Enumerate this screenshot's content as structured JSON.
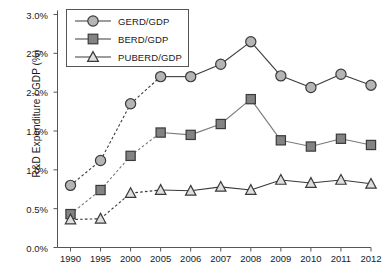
{
  "chart_data": {
    "type": "line",
    "title": "",
    "xlabel": "",
    "ylabel": "R&D Expenditure / GDP (%)",
    "categories": [
      "1990",
      "1995",
      "2000",
      "2005",
      "2006",
      "2007",
      "2008",
      "2009",
      "2010",
      "2011",
      "2012"
    ],
    "ylim": [
      0.0,
      3.0
    ],
    "ytick_labels": [
      "0.0%",
      "0.5%",
      "1.0%",
      "1.5%",
      "2.0%",
      "2.5%",
      "3.0%"
    ],
    "ytick_values": [
      0.0,
      0.5,
      1.0,
      1.5,
      2.0,
      2.5,
      3.0
    ],
    "grid": false,
    "legend_position": "top-left-inside",
    "series": [
      {
        "name": "GERD/GDP",
        "marker": "circle",
        "marker_fill": "#b5b5b5",
        "marker_stroke": "#3a3a3a",
        "line_color": "#3a3a3a",
        "values": [
          0.8,
          1.12,
          1.85,
          2.2,
          2.2,
          2.36,
          2.65,
          2.21,
          2.06,
          2.23,
          2.09
        ]
      },
      {
        "name": "BERD/GDP",
        "marker": "square",
        "marker_fill": "#838383",
        "marker_stroke": "#3a3a3a",
        "line_color": "#7a7a7a",
        "values": [
          0.43,
          0.74,
          1.18,
          1.48,
          1.45,
          1.59,
          1.91,
          1.38,
          1.3,
          1.4,
          1.32
        ]
      },
      {
        "name": "PUBERD/GDP",
        "marker": "triangle",
        "marker_fill": "#dedede",
        "marker_stroke": "#3a3a3a",
        "line_color": "#3a3a3a",
        "values": [
          0.36,
          0.37,
          0.7,
          0.74,
          0.73,
          0.78,
          0.74,
          0.87,
          0.83,
          0.87,
          0.82
        ]
      }
    ],
    "dashed_segment_categories": [
      "1990",
      "1995",
      "2000",
      "2005"
    ],
    "axis_color": "#555555"
  },
  "legend": {
    "items": [
      {
        "label": "GERD/GDP"
      },
      {
        "label": "BERD/GDP"
      },
      {
        "label": "PUBERD/GDP"
      }
    ]
  }
}
